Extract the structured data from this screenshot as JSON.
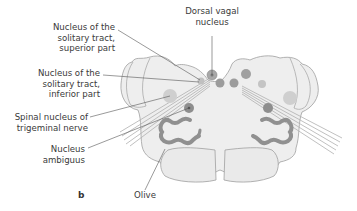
{
  "figure": {
    "panel_letter": "b"
  },
  "labels": {
    "nts_superior": "Nucleus of the\nsolitary tract,\nsuperior part",
    "nts_inferior": "Nucleus of the\nsolitary tract,\ninferior part",
    "spinal_trigeminal": "Spinal nucleus of\ntrigeminal nerve",
    "nucleus_ambiguus": "Nucleus\nambiguus",
    "dorsal_vagal": "Dorsal vagal\nnucleus",
    "olive": "Olive"
  },
  "colors": {
    "tissue_fill": "#eeeeee",
    "outline": "#9a9a9a",
    "nucleus_dark": "#8a8a8a",
    "nucleus_light": "#c8c8c8",
    "leader_line": "#555555",
    "text": "#3a3a3a"
  }
}
